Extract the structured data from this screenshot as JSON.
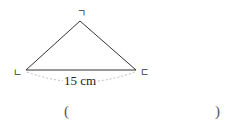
{
  "diagram": {
    "shape": "triangle",
    "vertices": {
      "top": {
        "label": "ㄱ",
        "x": 80,
        "y": 21
      },
      "left": {
        "label": "ㄴ",
        "x": 26,
        "y": 70
      },
      "right": {
        "label": "ㄷ",
        "x": 136,
        "y": 70
      }
    },
    "base_length_label": "15 cm",
    "line_color": "#333333",
    "dash_color": "#bbbbbb"
  },
  "answer": {
    "open_paren": "(",
    "close_paren": ")",
    "value": ""
  }
}
